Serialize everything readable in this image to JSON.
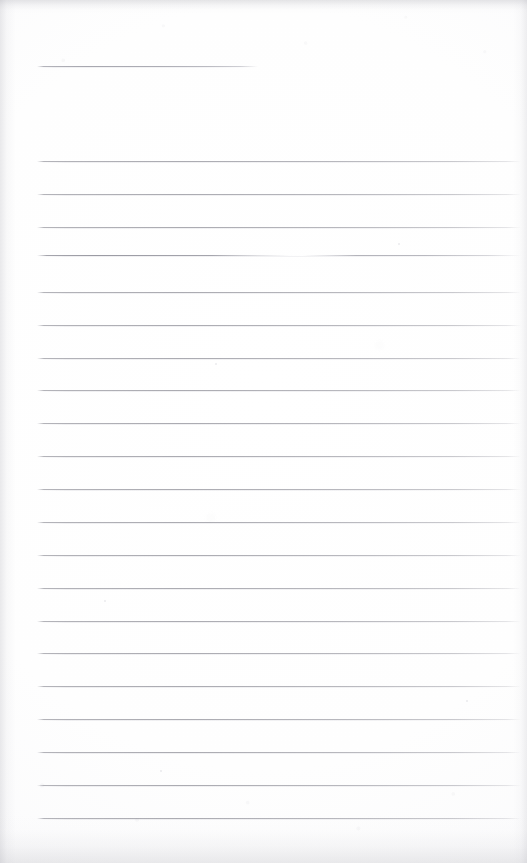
{
  "page": {
    "kind": "scanned-lined-notepad-page",
    "width": 527,
    "height": 863,
    "background_color": "#fefefe",
    "rule_color": "#96969e",
    "edge_shadow_color": "#a8a8af",
    "content_text": "",
    "visible_text": ""
  },
  "header_rule": {
    "name": "header-rule",
    "x": 37,
    "y": 66,
    "width": 221,
    "color": "#94949c"
  },
  "ruled_lines": {
    "count": 21,
    "first_y": 161,
    "spacing": 32.85,
    "x_start": 37,
    "x_end": 521,
    "broken_line_index": 3,
    "items": [
      {
        "index": 0,
        "y": 161,
        "broken": false
      },
      {
        "index": 1,
        "y": 194,
        "broken": false
      },
      {
        "index": 2,
        "y": 227,
        "broken": false
      },
      {
        "index": 3,
        "y": 255,
        "broken": true
      },
      {
        "index": 4,
        "y": 292,
        "broken": false
      },
      {
        "index": 5,
        "y": 325,
        "broken": false
      },
      {
        "index": 6,
        "y": 358,
        "broken": false
      },
      {
        "index": 7,
        "y": 390,
        "broken": false
      },
      {
        "index": 8,
        "y": 423,
        "broken": false
      },
      {
        "index": 9,
        "y": 456,
        "broken": false
      },
      {
        "index": 10,
        "y": 489,
        "broken": false
      },
      {
        "index": 11,
        "y": 522,
        "broken": false
      },
      {
        "index": 12,
        "y": 555,
        "broken": false
      },
      {
        "index": 13,
        "y": 588,
        "broken": false
      },
      {
        "index": 14,
        "y": 621,
        "broken": false
      },
      {
        "index": 15,
        "y": 653,
        "broken": false
      },
      {
        "index": 16,
        "y": 686,
        "broken": false
      },
      {
        "index": 17,
        "y": 719,
        "broken": false
      },
      {
        "index": 18,
        "y": 752,
        "broken": false
      },
      {
        "index": 19,
        "y": 785,
        "broken": false
      },
      {
        "index": 20,
        "y": 818,
        "broken": false
      }
    ]
  },
  "specks": [
    {
      "x": 215,
      "y": 363,
      "size": 2
    },
    {
      "x": 104,
      "y": 600,
      "size": 2
    },
    {
      "x": 398,
      "y": 243,
      "size": 2
    },
    {
      "x": 466,
      "y": 700,
      "size": 2
    },
    {
      "x": 160,
      "y": 770,
      "size": 2
    }
  ]
}
